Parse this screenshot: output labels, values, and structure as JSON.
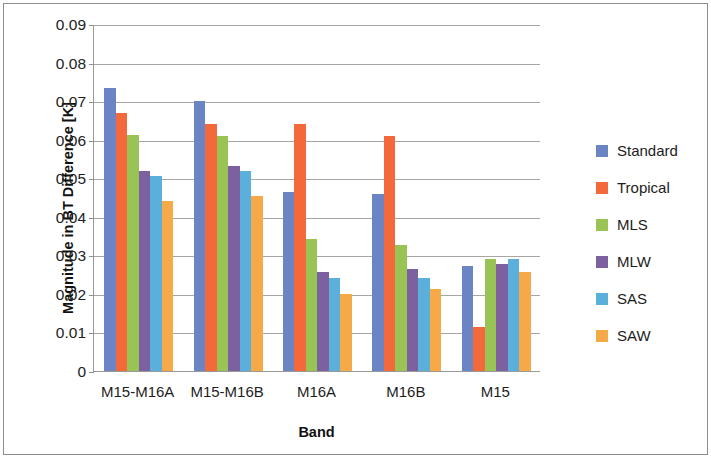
{
  "chart_data": {
    "type": "bar",
    "title": "",
    "xlabel": "Band",
    "ylabel": "Magnitude in BT Difference [K]",
    "categories": [
      "M15-M16A",
      "M15-M16B",
      "M16A",
      "M16B",
      "M15"
    ],
    "series": [
      {
        "name": "Standard",
        "color": "#6B85C4",
        "values": [
          0.0733,
          0.07,
          0.0465,
          0.0458,
          0.0272
        ]
      },
      {
        "name": "Tropical",
        "color": "#F4693C",
        "values": [
          0.067,
          0.064,
          0.064,
          0.061,
          0.0113
        ]
      },
      {
        "name": "MLS",
        "color": "#99C355",
        "values": [
          0.0612,
          0.061,
          0.0342,
          0.0328,
          0.029
        ]
      },
      {
        "name": "MLW",
        "color": "#7D60A0",
        "values": [
          0.052,
          0.0532,
          0.0258,
          0.0265,
          0.0278
        ]
      },
      {
        "name": "SAS",
        "color": "#5BB0DB",
        "values": [
          0.0505,
          0.052,
          0.024,
          0.024,
          0.029
        ]
      },
      {
        "name": "SAW",
        "color": "#F5A948",
        "values": [
          0.0442,
          0.0455,
          0.02,
          0.0212,
          0.0258
        ]
      }
    ],
    "ylim": [
      0,
      0.09
    ],
    "ytick_values": [
      0,
      0.01,
      0.02,
      0.03,
      0.04,
      0.05,
      0.06,
      0.07,
      0.08,
      0.09
    ],
    "ytick_labels": [
      "0",
      "0.01",
      "0.02",
      "0.03",
      "0.04",
      "0.05",
      "0.06",
      "0.07",
      "0.08",
      "0.09"
    ],
    "grid": true,
    "legend_position": "right"
  }
}
